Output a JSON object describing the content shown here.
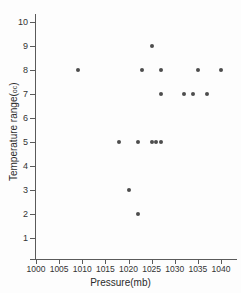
{
  "title_faint": "",
  "axes": {
    "x_title": "Pressure(mb)",
    "y_title_main": "Temperature range(",
    "y_title_unit": "oc",
    "y_title_close": ")",
    "x_ticks": [
      "1000",
      "1005",
      "1010",
      "1015",
      "1020",
      "1025",
      "1030",
      "1035",
      "1040"
    ],
    "y_ticks": [
      "10",
      "9",
      "8",
      "7",
      "6",
      "5",
      "4",
      "3",
      "2",
      "1"
    ]
  },
  "style": {
    "point_color": "#4d4d4d",
    "axis_color": "#5a5a5a",
    "background": "#fdfdfd",
    "text_color": "#333333"
  },
  "chart_data": {
    "type": "scatter",
    "title": "",
    "xlabel": "Pressure(mb)",
    "ylabel": "Temperature range(oc)",
    "xlim": [
      1000,
      1040
    ],
    "ylim": [
      0,
      10
    ],
    "xticks": [
      1000,
      1005,
      1010,
      1015,
      1020,
      1025,
      1030,
      1035,
      1040
    ],
    "yticks": [
      1,
      2,
      3,
      4,
      5,
      6,
      7,
      8,
      9,
      10
    ],
    "grid": false,
    "legend": "none",
    "series": [
      {
        "name": "observations",
        "marker": "circle",
        "color": "#4d4d4d",
        "x": [
          1009,
          1018,
          1020,
          1022,
          1022,
          1023,
          1025,
          1025,
          1026,
          1027,
          1027,
          1027,
          1032,
          1034,
          1035,
          1037,
          1040
        ],
        "y": [
          8,
          5,
          3,
          2,
          5,
          8,
          5,
          9,
          5,
          5,
          7,
          8,
          7,
          7,
          8,
          7,
          8
        ]
      }
    ],
    "points": [
      {
        "x": 1009,
        "y": 8
      },
      {
        "x": 1018,
        "y": 5
      },
      {
        "x": 1020,
        "y": 3
      },
      {
        "x": 1022,
        "y": 2
      },
      {
        "x": 1022,
        "y": 5
      },
      {
        "x": 1023,
        "y": 8
      },
      {
        "x": 1025,
        "y": 9
      },
      {
        "x": 1025,
        "y": 5
      },
      {
        "x": 1026,
        "y": 5
      },
      {
        "x": 1027,
        "y": 5
      },
      {
        "x": 1027,
        "y": 7
      },
      {
        "x": 1027,
        "y": 8
      },
      {
        "x": 1032,
        "y": 7
      },
      {
        "x": 1034,
        "y": 7
      },
      {
        "x": 1035,
        "y": 8
      },
      {
        "x": 1037,
        "y": 7
      },
      {
        "x": 1040,
        "y": 8
      }
    ]
  }
}
